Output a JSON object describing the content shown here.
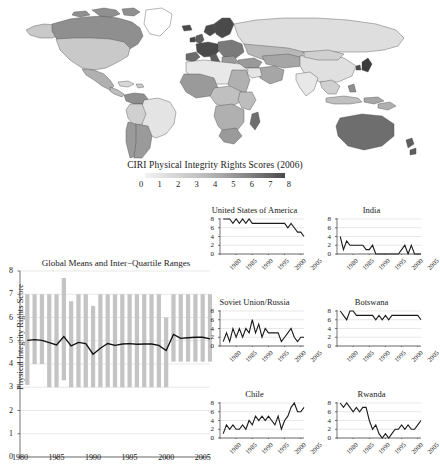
{
  "figure": {
    "map": {
      "name": "world-choropleth-map",
      "projection": "equirectangular",
      "no_data_color": "#ffffff",
      "border_color": "#444444"
    },
    "legend": {
      "title": "CIRI Physical Integrity Rights Scores (2006)",
      "ticks": [
        "0",
        "1",
        "2",
        "3",
        "4",
        "5",
        "6",
        "7",
        "8"
      ],
      "gradient_low_color": "#f2f2f2",
      "gradient_high_color": "#4a4a4a"
    }
  },
  "chart_data": [
    {
      "name": "global-means-iqr",
      "type": "bar",
      "title": "Global Means and Inter−Quartile Ranges",
      "xlabel": "",
      "ylabel": "Physical Integrity Rights Score",
      "xlim": [
        1980,
        2006
      ],
      "ylim": [
        0,
        8
      ],
      "yticks": [
        0,
        1,
        2,
        3,
        4,
        5,
        6,
        7,
        8
      ],
      "xticks": [
        1980,
        1985,
        1990,
        1995,
        2000,
        2005
      ],
      "grid": true,
      "legend_position": "none",
      "bar_color": "#c4c4c4",
      "line_color": "#111111",
      "x": [
        1981,
        1982,
        1983,
        1984,
        1985,
        1986,
        1987,
        1988,
        1989,
        1990,
        1991,
        1992,
        1993,
        1994,
        1995,
        1996,
        1997,
        1998,
        1999,
        2000,
        2001,
        2002,
        2003,
        2004,
        2005,
        2006
      ],
      "series": [
        {
          "name": "Inter-Quartile Range (lower)",
          "values": [
            3.1,
            4.0,
            4.0,
            3.0,
            3.0,
            3.3,
            3.0,
            3.0,
            3.0,
            3.0,
            3.0,
            3.0,
            3.0,
            3.0,
            3.0,
            3.0,
            3.0,
            3.0,
            3.0,
            3.0,
            4.1,
            4.1,
            4.1,
            4.1,
            4.1,
            4.1
          ]
        },
        {
          "name": "Inter-Quartile Range (upper)",
          "values": [
            7.0,
            7.0,
            7.0,
            7.0,
            7.0,
            7.7,
            6.7,
            7.0,
            7.0,
            6.5,
            7.0,
            7.0,
            7.0,
            7.0,
            7.0,
            7.0,
            7.0,
            7.0,
            7.0,
            6.0,
            7.0,
            7.0,
            7.0,
            7.0,
            7.0,
            7.0
          ]
        },
        {
          "name": "Global Mean",
          "values": [
            5.02,
            5.05,
            5.02,
            4.92,
            4.82,
            5.18,
            4.78,
            4.93,
            4.88,
            4.42,
            4.68,
            4.88,
            4.8,
            4.86,
            4.88,
            4.85,
            4.86,
            4.86,
            4.8,
            4.58,
            5.27,
            5.1,
            5.13,
            5.15,
            5.15,
            5.08
          ]
        }
      ]
    },
    {
      "name": "united-states-of-america",
      "type": "line",
      "title": "United States of America",
      "ylim": [
        0,
        8
      ],
      "yticks": [
        0,
        2,
        4,
        6,
        8
      ],
      "xticks": [
        1980,
        1985,
        1990,
        1995,
        2000,
        2005
      ],
      "xlim": [
        1980,
        2006
      ],
      "grid": true,
      "x": [
        1981,
        1982,
        1983,
        1984,
        1985,
        1986,
        1987,
        1988,
        1989,
        1990,
        1991,
        1992,
        1993,
        1994,
        1995,
        1996,
        1997,
        1998,
        1999,
        2000,
        2001,
        2002,
        2003,
        2004,
        2005,
        2006
      ],
      "values": [
        8,
        8,
        8,
        7,
        8,
        7,
        8,
        7,
        8,
        7,
        7,
        7,
        7,
        7,
        7,
        7,
        7,
        7,
        7,
        7,
        6,
        7,
        6,
        5,
        5,
        4
      ]
    },
    {
      "name": "india",
      "type": "line",
      "title": "India",
      "ylim": [
        0,
        8
      ],
      "yticks": [
        0,
        2,
        4,
        6,
        8
      ],
      "xticks": [
        1980,
        1985,
        1990,
        1995,
        2000,
        2005
      ],
      "xlim": [
        1980,
        2006
      ],
      "grid": true,
      "x": [
        1981,
        1982,
        1983,
        1984,
        1985,
        1986,
        1987,
        1988,
        1989,
        1990,
        1991,
        1992,
        1993,
        1994,
        1995,
        1996,
        1997,
        1998,
        1999,
        2000,
        2001,
        2002,
        2003,
        2004,
        2005,
        2006
      ],
      "values": [
        4,
        1,
        3,
        2,
        2,
        2,
        2,
        2,
        1,
        1,
        2,
        0,
        0,
        0,
        0,
        0,
        0,
        0,
        0,
        1,
        2,
        0,
        2,
        0,
        0,
        0
      ]
    },
    {
      "name": "soviet-union-russia",
      "type": "line",
      "title": "Soviet Union/Russia",
      "ylim": [
        0,
        8
      ],
      "yticks": [
        0,
        2,
        4,
        6,
        8
      ],
      "xticks": [
        1980,
        1985,
        1990,
        1995,
        2000,
        2005
      ],
      "xlim": [
        1980,
        2006
      ],
      "grid": true,
      "x": [
        1981,
        1982,
        1983,
        1984,
        1985,
        1986,
        1987,
        1988,
        1989,
        1990,
        1991,
        1992,
        1993,
        1994,
        1995,
        1996,
        1997,
        1998,
        1999,
        2000,
        2001,
        2002,
        2003,
        2004,
        2005,
        2006
      ],
      "values": [
        1,
        3,
        1,
        4,
        2,
        4,
        2,
        4,
        3,
        6,
        3,
        5,
        2,
        4,
        3,
        3,
        3,
        3,
        1,
        2,
        3,
        4,
        2,
        1,
        2,
        2
      ]
    },
    {
      "name": "botswana",
      "type": "line",
      "title": "Botswana",
      "ylim": [
        0,
        8
      ],
      "yticks": [
        0,
        2,
        4,
        6,
        8
      ],
      "xticks": [
        1980,
        1985,
        1990,
        1995,
        2000,
        2005
      ],
      "xlim": [
        1980,
        2006
      ],
      "grid": true,
      "x": [
        1981,
        1982,
        1983,
        1984,
        1985,
        1986,
        1987,
        1988,
        1989,
        1990,
        1991,
        1992,
        1993,
        1994,
        1995,
        1996,
        1997,
        1998,
        1999,
        2000,
        2001,
        2002,
        2003,
        2004,
        2005,
        2006
      ],
      "values": [
        8,
        7,
        6,
        8,
        8,
        7,
        7,
        7,
        7,
        7,
        7,
        6,
        7,
        6,
        7,
        6,
        7,
        7,
        7,
        7,
        7,
        7,
        7,
        7,
        7,
        6
      ]
    },
    {
      "name": "chile",
      "type": "line",
      "title": "Chile",
      "ylim": [
        0,
        8
      ],
      "yticks": [
        0,
        2,
        4,
        6,
        8
      ],
      "xticks": [
        1980,
        1985,
        1990,
        1995,
        2000,
        2005
      ],
      "xlim": [
        1980,
        2006
      ],
      "grid": true,
      "x": [
        1981,
        1982,
        1983,
        1984,
        1985,
        1986,
        1987,
        1988,
        1989,
        1990,
        1991,
        1992,
        1993,
        1994,
        1995,
        1996,
        1997,
        1998,
        1999,
        2000,
        2001,
        2002,
        2003,
        2004,
        2005,
        2006
      ],
      "values": [
        1,
        3,
        2,
        3,
        2,
        2,
        3,
        2,
        4,
        3,
        5,
        4,
        5,
        4,
        5,
        4,
        3,
        5,
        2,
        4,
        5,
        7,
        8,
        6,
        6,
        7
      ]
    },
    {
      "name": "rwanda",
      "type": "line",
      "title": "Rwanda",
      "ylim": [
        0,
        8
      ],
      "yticks": [
        0,
        2,
        4,
        6,
        8
      ],
      "xticks": [
        1980,
        1985,
        1990,
        1995,
        2000,
        2005
      ],
      "xlim": [
        1980,
        2006
      ],
      "grid": true,
      "x": [
        1981,
        1982,
        1983,
        1984,
        1985,
        1986,
        1987,
        1988,
        1989,
        1990,
        1991,
        1992,
        1993,
        1994,
        1995,
        1996,
        1997,
        1998,
        1999,
        2000,
        2001,
        2002,
        2003,
        2004,
        2005,
        2006
      ],
      "values": [
        8,
        7,
        8,
        7,
        6,
        7,
        6,
        7,
        7,
        4,
        2,
        3,
        1,
        0,
        1,
        0,
        1,
        2,
        2,
        3,
        2,
        3,
        2,
        2,
        3,
        4
      ]
    }
  ]
}
